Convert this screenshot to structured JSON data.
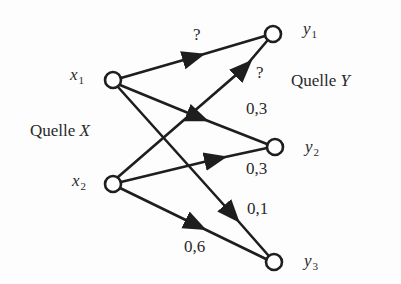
{
  "diagram": {
    "type": "channel-transition-graph",
    "sources": {
      "input_label": "Quelle",
      "input_var": "X",
      "output_label": "Quelle",
      "output_var": "Y"
    },
    "nodes": [
      {
        "id": "x1",
        "var": "x",
        "sub": "1",
        "cx": 113,
        "cy": 80
      },
      {
        "id": "x2",
        "var": "x",
        "sub": "2",
        "cx": 113,
        "cy": 184
      },
      {
        "id": "y1",
        "var": "y",
        "sub": "1",
        "cx": 273,
        "cy": 34
      },
      {
        "id": "y2",
        "var": "y",
        "sub": "2",
        "cx": 275,
        "cy": 147
      },
      {
        "id": "y3",
        "var": "y",
        "sub": "3",
        "cx": 274,
        "cy": 262
      }
    ],
    "edges": [
      {
        "from": "x1",
        "to": "y1",
        "label": "?"
      },
      {
        "from": "x1",
        "to": "y2",
        "label": "0,3"
      },
      {
        "from": "x1",
        "to": "y3",
        "label": "0,1"
      },
      {
        "from": "x2",
        "to": "y1",
        "label": "?"
      },
      {
        "from": "x2",
        "to": "y2",
        "label": "0,3"
      },
      {
        "from": "x2",
        "to": "y3",
        "label": "0,6"
      }
    ],
    "colors": {
      "stroke": "#1e1e1e",
      "text": "#2a2a2a",
      "background": "#fdfdfd"
    }
  }
}
